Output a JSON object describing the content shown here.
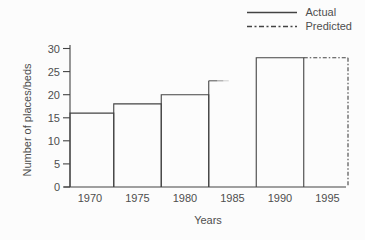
{
  "colors": {
    "line": "#434343",
    "text": "#4e4e4e",
    "background": "#fcfcfc"
  },
  "chart_data": {
    "type": "bar",
    "subtype": "outlined-step-histogram",
    "title": "",
    "xlabel": "Years",
    "ylabel": "Number of places/beds",
    "x_ticks": [
      "1970",
      "1975",
      "1980",
      "1985",
      "1990",
      "1995"
    ],
    "y_ticks": [
      0,
      5,
      10,
      15,
      20,
      25,
      30
    ],
    "ylim": [
      0,
      30
    ],
    "bar_width_years": 5,
    "grid": "off",
    "legend": [
      {
        "label": "Actual",
        "line_style": "solid"
      },
      {
        "label": "Predicted",
        "line_style": "dash-dot"
      }
    ],
    "series": [
      {
        "name": "Actual",
        "years": [
          1970,
          1975,
          1980,
          1985,
          1990
        ],
        "values": [
          16,
          18,
          20,
          23,
          28
        ]
      },
      {
        "name": "Predicted",
        "years": [
          1995
        ],
        "values": [
          28
        ]
      }
    ],
    "bars": [
      {
        "year": 1970,
        "value": 16,
        "series": "Actual",
        "outline": "full"
      },
      {
        "year": 1975,
        "value": 18,
        "series": "Actual",
        "outline": "full"
      },
      {
        "year": 1980,
        "value": 20,
        "series": "Actual",
        "outline": "full"
      },
      {
        "year": 1985,
        "value": 23,
        "series": "Actual",
        "outline": "partial-faded"
      },
      {
        "year": 1990,
        "value": 28,
        "series": "Actual",
        "outline": "full"
      },
      {
        "year": 1995,
        "value": 28,
        "series": "Predicted",
        "outline": "dashed"
      }
    ]
  }
}
